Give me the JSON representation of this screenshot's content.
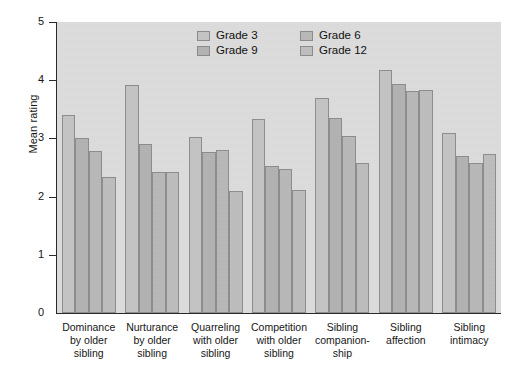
{
  "chart_data": {
    "type": "bar",
    "title": "",
    "xlabel": "",
    "ylabel": "Mean rating",
    "ylim": [
      0,
      5
    ],
    "yticks": [
      "0",
      "1",
      "2",
      "3",
      "4",
      "5"
    ],
    "grid": false,
    "legend_position": "top-right-inside",
    "categories": [
      "Dominance by older sibling",
      "Nurturance by older sibling",
      "Quarreling with older sibling",
      "Competition with older sibling",
      "Sibling companionship",
      "Sibling affection",
      "Sibling intimacy"
    ],
    "category_lines": [
      [
        "Dominance",
        "by older",
        "sibling"
      ],
      [
        "Nurturance",
        "by older",
        "sibling"
      ],
      [
        "Quarreling",
        "with older",
        "sibling"
      ],
      [
        "Competition",
        "with older",
        "sibling"
      ],
      [
        "Sibling",
        "companion-",
        "ship"
      ],
      [
        "Sibling",
        "affection",
        ""
      ],
      [
        "Sibling",
        "intimacy",
        ""
      ]
    ],
    "series": [
      {
        "name": "Grade 3",
        "color": "#c3c3c3",
        "values": [
          3.4,
          3.92,
          3.02,
          3.33,
          3.7,
          4.17,
          3.1
        ]
      },
      {
        "name": "Grade 9",
        "color": "#b2b2b2",
        "values": [
          3.0,
          2.9,
          2.77,
          2.53,
          3.35,
          3.93,
          2.7
        ]
      },
      {
        "name": "Grade 6",
        "color": "#b8b8b8",
        "values": [
          2.78,
          2.43,
          2.8,
          2.48,
          3.05,
          3.82,
          2.57
        ]
      },
      {
        "name": "Grade 12",
        "color": "#bdbdbd",
        "values": [
          2.33,
          2.43,
          2.1,
          2.12,
          2.57,
          3.84,
          2.73
        ]
      }
    ],
    "legend_order": [
      "Grade 3",
      "Grade 6",
      "Grade 9",
      "Grade 12"
    ],
    "plot_background": "#dcdcdc",
    "axis_color": "#2a2a2a"
  }
}
